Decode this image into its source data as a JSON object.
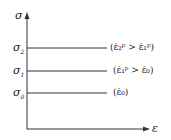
{
  "diagram": {
    "y_axis_label": "σ",
    "x_axis_label": "ε",
    "levels": [
      {
        "name": "σ2",
        "symbol": "σ",
        "sub": "2",
        "y": 48,
        "condition": "(ε̇₂ᵖ > ε̇₁ᵖ)"
      },
      {
        "name": "σ1",
        "symbol": "σ",
        "sub": "1",
        "y": 71,
        "condition": "(ε̇₁ᵖ > ε̇₀)"
      },
      {
        "name": "σ0",
        "symbol": "σ",
        "sub": "0",
        "y": 93,
        "condition": "(ε̇₀)"
      }
    ],
    "line_color": "#333333"
  }
}
